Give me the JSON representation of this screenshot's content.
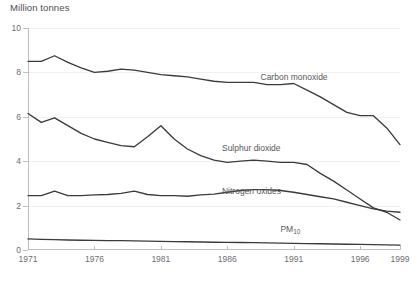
{
  "chart_data": {
    "type": "line",
    "title": "Million tonnes",
    "xlabel": "",
    "ylabel": "",
    "ylim": [
      0,
      10
    ],
    "xlim": [
      1971,
      1999
    ],
    "grid": true,
    "legend_position": "inline-labels",
    "yticks": [
      "0",
      "2",
      "4",
      "6",
      "8",
      "10"
    ],
    "ytick_values": [
      0,
      2,
      4,
      6,
      8,
      10
    ],
    "xticks": [
      "1971",
      "1976",
      "1981",
      "1986",
      "1991",
      "1996",
      "1999"
    ],
    "xtick_values": [
      1971,
      1976,
      1981,
      1986,
      1991,
      1996,
      1999
    ],
    "x": [
      1971,
      1972,
      1973,
      1974,
      1975,
      1976,
      1977,
      1978,
      1979,
      1980,
      1981,
      1982,
      1983,
      1984,
      1985,
      1986,
      1987,
      1988,
      1989,
      1990,
      1991,
      1992,
      1993,
      1994,
      1995,
      1996,
      1997,
      1998,
      1999
    ],
    "series": [
      {
        "name": "Carbon monoxide",
        "label": "Carbon monoxide",
        "color": "#3b3b3d",
        "values": [
          8.5,
          8.5,
          8.75,
          8.45,
          8.2,
          8.0,
          8.05,
          8.15,
          8.1,
          8.0,
          7.9,
          7.85,
          7.8,
          7.7,
          7.6,
          7.55,
          7.55,
          7.55,
          7.45,
          7.45,
          7.5,
          7.2,
          6.9,
          6.55,
          6.2,
          6.05,
          6.05,
          5.5,
          4.75
        ],
        "label_x": 1988.5,
        "label_y": 7.55
      },
      {
        "name": "Sulphur dioxide",
        "label": "Sulphur dioxide",
        "color": "#3b3b3d",
        "values": [
          6.15,
          5.75,
          5.95,
          5.6,
          5.25,
          5.0,
          4.85,
          4.7,
          4.65,
          5.1,
          5.6,
          5.0,
          4.55,
          4.25,
          4.05,
          3.95,
          4.0,
          4.05,
          4.0,
          3.95,
          3.95,
          3.85,
          3.45,
          3.1,
          2.7,
          2.3,
          1.9,
          1.7,
          1.35
        ],
        "label_x": 1985.6,
        "label_y": 4.35
      },
      {
        "name": "Nitrogen oxides",
        "label": "Nitrogen oxides",
        "color": "#3b3b3d",
        "values": [
          2.45,
          2.45,
          2.65,
          2.45,
          2.45,
          2.48,
          2.5,
          2.55,
          2.65,
          2.5,
          2.45,
          2.45,
          2.42,
          2.48,
          2.52,
          2.6,
          2.68,
          2.72,
          2.72,
          2.68,
          2.6,
          2.5,
          2.4,
          2.3,
          2.15,
          2.0,
          1.85,
          1.75,
          1.7
        ],
        "label_x": 1985.6,
        "label_y": 2.42
      },
      {
        "name": "PM10",
        "label_html": "PM<sub>10</sub>",
        "color": "#6d6d70",
        "values": [
          0.5,
          0.48,
          0.47,
          0.45,
          0.44,
          0.43,
          0.42,
          0.42,
          0.41,
          0.4,
          0.39,
          0.38,
          0.37,
          0.36,
          0.35,
          0.34,
          0.34,
          0.33,
          0.32,
          0.31,
          0.3,
          0.29,
          0.28,
          0.27,
          0.26,
          0.25,
          0.24,
          0.23,
          0.22
        ],
        "label_x": 1990.0,
        "label_y": 0.72
      }
    ]
  }
}
